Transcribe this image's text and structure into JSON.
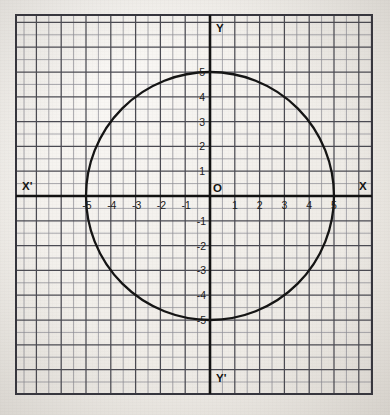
{
  "figure": {
    "title": "",
    "paper_color": "#efece7",
    "ink_color": "#1a1a1a",
    "grid_color": "#4a4a52",
    "minor_grid_color": "#8d8d95"
  },
  "axis_names": {
    "x_positive": "X",
    "x_negative": "X'",
    "y_positive": "Y",
    "y_negative": "Y'",
    "origin": "O"
  },
  "ticks": {
    "x_negative": [
      "-5",
      "-4",
      "-3",
      "-2",
      "-1"
    ],
    "x_positive": [
      "1",
      "2",
      "3",
      "4",
      "5"
    ],
    "y_positive": [
      "1",
      "2",
      "3",
      "4",
      "5"
    ],
    "y_negative": [
      "-1",
      "-2",
      "-3",
      "-4",
      "-5"
    ]
  },
  "chart_data": {
    "type": "line",
    "title": "",
    "xlabel": "X",
    "ylabel": "Y",
    "xlim": [
      -7,
      7
    ],
    "ylim": [
      -7,
      7
    ],
    "grid": true,
    "legend": "none",
    "curves": [
      {
        "name": "circle",
        "equation": "x^2 + y^2 = 25",
        "shape": "circle",
        "center": [
          0,
          0
        ],
        "radius": 5,
        "intercepts": {
          "x": [
            -5,
            5
          ],
          "y": [
            -5,
            5
          ]
        },
        "color": "#111111",
        "linewidth": 2.2
      }
    ],
    "xticks": [
      -5,
      -4,
      -3,
      -2,
      -1,
      1,
      2,
      3,
      4,
      5
    ],
    "yticks": [
      -5,
      -4,
      -3,
      -2,
      -1,
      1,
      2,
      3,
      4,
      5
    ],
    "minor_grid_step": 0.5,
    "major_grid_step": 1
  },
  "geometry": {
    "origin_px": [
      210,
      196
    ],
    "unit_px": 24.8,
    "minor_px": 12.4,
    "grid_left_px": 16,
    "grid_top_px": 15,
    "grid_right_px": 372,
    "grid_bottom_px": 394
  }
}
